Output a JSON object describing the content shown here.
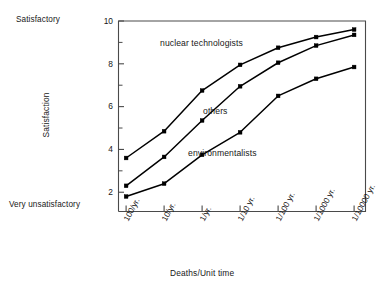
{
  "chart_data": {
    "type": "line",
    "title": "",
    "xlabel": "Deaths/Unit time",
    "ylabel": "Satisfaction",
    "categories": [
      "100/yr.",
      "10/yr.",
      "1/yr.",
      "1/10 yr.",
      "1/100 yr.",
      "1/1000 yr.",
      "1/10000 yr."
    ],
    "x": [
      0,
      1,
      2,
      3,
      4,
      5,
      6
    ],
    "ylim": [
      1.1,
      10
    ],
    "xlim": [
      -0.2,
      6.3
    ],
    "yticks_major": [
      2,
      4,
      6,
      8,
      10
    ],
    "yticks_minor": [
      3,
      5,
      7,
      9
    ],
    "grid": false,
    "legend_position": "inline-annotations",
    "axis_end_labels": {
      "y_top": "Satisfactory",
      "y_bottom": "Very unsatisfactory"
    },
    "series": [
      {
        "name": "nuclear technologists",
        "values": [
          3.6,
          4.85,
          6.75,
          7.95,
          8.75,
          9.25,
          9.6
        ],
        "color": "#000000",
        "annotation": "nuclear technologists"
      },
      {
        "name": "others",
        "values": [
          2.3,
          3.65,
          5.35,
          6.95,
          8.05,
          8.85,
          9.35
        ],
        "color": "#000000",
        "annotation": "others"
      },
      {
        "name": "environmentalists",
        "values": [
          1.8,
          2.4,
          3.75,
          4.8,
          6.5,
          7.3,
          7.85
        ],
        "color": "#000000",
        "annotation": "environmentalists"
      }
    ]
  },
  "axis": {
    "y_top_caption": "Satisfactory",
    "y_bottom_caption": "Very unsatisfactory",
    "y_title": "Satisfaction",
    "x_title": "Deaths/Unit time",
    "y_tick_labels": [
      "10",
      "8",
      "6",
      "4",
      "2"
    ],
    "x_tick_labels": [
      "100/yr.",
      "10/yr.",
      "1/yr.",
      "1/10 yr.",
      "1/100 yr.",
      "1/1000 yr.",
      "1/10000 yr."
    ]
  },
  "annotations": {
    "nuclear": "nuclear technologists",
    "others": "others",
    "environmentalists": "environmentalists"
  },
  "colors": {
    "line": "#000000",
    "axis": "#4a4a4a",
    "text": "#171717",
    "background": "#ffffff"
  }
}
